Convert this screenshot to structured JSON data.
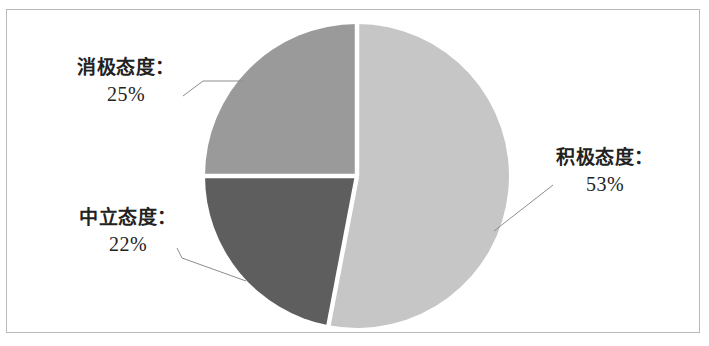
{
  "figure": {
    "background_color": "#ffffff",
    "frame_color": "#b9b9b9",
    "width": 709,
    "height": 346
  },
  "chart_data": {
    "type": "pie",
    "title": "",
    "subtitle": "",
    "xlabel": "",
    "ylabel": "",
    "legend_position": "none",
    "grid": false,
    "label_format": "{name}：{value}%",
    "start_angle_deg": 90,
    "direction": "clockwise",
    "categories": [
      "积极态度",
      "中立态度",
      "消极态度"
    ],
    "values": [
      53,
      22,
      25
    ],
    "colors": [
      "#c6c6c6",
      "#5e5e5e",
      "#9a9a9a"
    ],
    "slices": [
      {
        "name": "积极态度",
        "label": "积极态度：",
        "value": 53,
        "value_text": "53%",
        "color": "#c6c6c6",
        "start_deg": 90,
        "end_deg": 280.8
      },
      {
        "name": "中立态度",
        "label": "中立态度：",
        "value": 22,
        "value_text": "22%",
        "color": "#5e5e5e",
        "start_deg": 280.8,
        "end_deg": 360
      },
      {
        "name": "消极态度",
        "label": "消极态度：",
        "value": 25,
        "value_text": "25%",
        "color": "#9a9a9a",
        "start_deg": 0,
        "end_deg": 90
      }
    ],
    "geometry": {
      "center_x": 357,
      "center_y": 176,
      "radius": 152,
      "separator_color": "#ffffff",
      "separator_width": 4
    }
  },
  "labels": {
    "negative": {
      "name": "消极态度：",
      "value": "25%"
    },
    "neutral": {
      "name": "中立态度：",
      "value": "22%"
    },
    "positive": {
      "name": "积极态度：",
      "value": "53%"
    }
  },
  "leader_lines": {
    "color": "#8d8d8d",
    "width": 1
  }
}
